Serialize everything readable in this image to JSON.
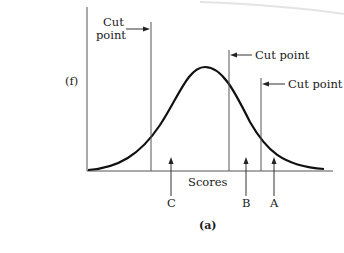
{
  "figure": {
    "type": "normal-distribution-diagram",
    "y_axis_label": "(f)",
    "x_axis_label": "Scores",
    "caption": "(a)",
    "cut_points": [
      {
        "label_line1": "Cut",
        "label_line2": "point",
        "position": "left",
        "arrow_direction": "right"
      },
      {
        "label": "Cut point",
        "position": "right-upper",
        "arrow_direction": "left"
      },
      {
        "label": "Cut point",
        "position": "right-lower",
        "arrow_direction": "left"
      }
    ],
    "score_markers": [
      {
        "label": "C",
        "region": "between first and second cut points"
      },
      {
        "label": "B",
        "region": "between second and third cut points"
      },
      {
        "label": "A",
        "region": "above third cut point"
      }
    ],
    "colors": {
      "curve": "#111111",
      "axes": "#555555",
      "text": "#1a1a1a",
      "background": "#ffffff"
    }
  }
}
